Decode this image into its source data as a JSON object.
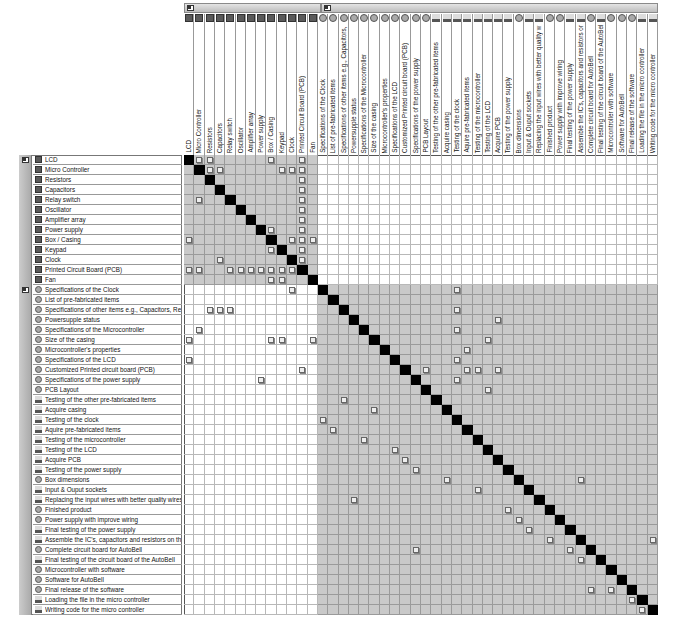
{
  "groups": [
    {
      "name": "components",
      "icon": "group-collapse-icon",
      "start": 0,
      "end": 12
    },
    {
      "name": "process",
      "icon": "group-collapse-icon",
      "start": 13,
      "end": 45
    }
  ],
  "items": [
    {
      "label": "LCD",
      "type": "comp"
    },
    {
      "label": "Micro Controller",
      "type": "comp"
    },
    {
      "label": "Resistors",
      "type": "comp"
    },
    {
      "label": "Capacitors",
      "type": "comp"
    },
    {
      "label": "Relay switch",
      "type": "comp"
    },
    {
      "label": "Oscillator",
      "type": "comp"
    },
    {
      "label": "Amplifier array",
      "type": "comp"
    },
    {
      "label": "Power supply",
      "type": "comp"
    },
    {
      "label": "Box / Casing",
      "type": "comp"
    },
    {
      "label": "Keypad",
      "type": "comp"
    },
    {
      "label": "Clock",
      "type": "comp"
    },
    {
      "label": "Printed Circuit Board (PCB)",
      "type": "comp"
    },
    {
      "label": "Fan",
      "type": "comp"
    },
    {
      "label": "Specifications of the Clock",
      "type": "spec"
    },
    {
      "label": "List of pre-fabricated items",
      "type": "spec"
    },
    {
      "label": "Specifications of other items e.g., Capacitors, Resistors etc",
      "type": "spec"
    },
    {
      "label": "Powersupple status",
      "type": "spec"
    },
    {
      "label": "Specifications of the Microcontroller",
      "type": "spec"
    },
    {
      "label": "Size of the casing",
      "type": "spec"
    },
    {
      "label": "Microcontroller's properties",
      "type": "spec"
    },
    {
      "label": "Specifications of the LCD",
      "type": "spec"
    },
    {
      "label": "Customized Printed circuit board (PCB)",
      "type": "spec"
    },
    {
      "label": "Specifications of the power supply",
      "type": "spec"
    },
    {
      "label": "PCB Layout",
      "type": "spec"
    },
    {
      "label": "Testing of the other pre-fabricated items",
      "type": "task"
    },
    {
      "label": "Acquire casing",
      "type": "task"
    },
    {
      "label": "Testing of the clock",
      "type": "task"
    },
    {
      "label": "Aquire pre-fabricated items",
      "type": "task"
    },
    {
      "label": "Testing of the microcontroller",
      "type": "task"
    },
    {
      "label": "Testing of the LCD",
      "type": "task"
    },
    {
      "label": "Acquire PCB",
      "type": "task"
    },
    {
      "label": "Testing of the power supply",
      "type": "task"
    },
    {
      "label": "Box dimensions",
      "type": "spec"
    },
    {
      "label": "Input & Ouput sockets",
      "type": "task"
    },
    {
      "label": "Replacing the input wires with better quality wires for product",
      "type": "task"
    },
    {
      "label": "Finished product",
      "type": "spec"
    },
    {
      "label": "Power supply with improve wiring",
      "type": "spec"
    },
    {
      "label": "Final testing of the power supply",
      "type": "task"
    },
    {
      "label": "Assemble the IC's, capacitors and resistors on the PCB",
      "type": "task"
    },
    {
      "label": "Complete circuit board for AutoBell",
      "type": "spec"
    },
    {
      "label": "Final testing of the circuit board of the AutoBell",
      "type": "task"
    },
    {
      "label": "Microcontroller with software",
      "type": "spec"
    },
    {
      "label": "Software for AutoBell",
      "type": "spec"
    },
    {
      "label": "Final release of the software",
      "type": "spec"
    },
    {
      "label": "Loading the file in the micro controller",
      "type": "task"
    },
    {
      "label": "Writing code for the micro controller",
      "type": "task"
    },
    {
      "label": "Testing the software",
      "type": "task"
    },
    {
      "label": "Final testing of the MC",
      "type": "task"
    },
    {
      "label": "Fully tested MC",
      "type": "spec"
    }
  ],
  "dependencies": [
    [
      0,
      1
    ],
    [
      0,
      2
    ],
    [
      0,
      8
    ],
    [
      0,
      11
    ],
    [
      1,
      2
    ],
    [
      1,
      3
    ],
    [
      1,
      9
    ],
    [
      1,
      10
    ],
    [
      1,
      11
    ],
    [
      2,
      11
    ],
    [
      3,
      11
    ],
    [
      4,
      1
    ],
    [
      4,
      11
    ],
    [
      5,
      11
    ],
    [
      6,
      11
    ],
    [
      7,
      8
    ],
    [
      7,
      11
    ],
    [
      8,
      0
    ],
    [
      8,
      8
    ],
    [
      8,
      10
    ],
    [
      8,
      11
    ],
    [
      8,
      12
    ],
    [
      9,
      8
    ],
    [
      9,
      11
    ],
    [
      10,
      3
    ],
    [
      10,
      11
    ],
    [
      11,
      0
    ],
    [
      11,
      1
    ],
    [
      11,
      4
    ],
    [
      11,
      5
    ],
    [
      11,
      6
    ],
    [
      11,
      7
    ],
    [
      11,
      8
    ],
    [
      11,
      9
    ],
    [
      11,
      10
    ],
    [
      12,
      8
    ],
    [
      12,
      9
    ],
    [
      13,
      10
    ],
    [
      13,
      26
    ],
    [
      15,
      2
    ],
    [
      15,
      3
    ],
    [
      15,
      4
    ],
    [
      15,
      26
    ],
    [
      16,
      30
    ],
    [
      17,
      1
    ],
    [
      17,
      26
    ],
    [
      18,
      0
    ],
    [
      18,
      8
    ],
    [
      18,
      9
    ],
    [
      18,
      12
    ],
    [
      18,
      29
    ],
    [
      19,
      27
    ],
    [
      20,
      0
    ],
    [
      20,
      26
    ],
    [
      21,
      11
    ],
    [
      21,
      23
    ],
    [
      21,
      27
    ],
    [
      21,
      28
    ],
    [
      21,
      30
    ],
    [
      22,
      7
    ],
    [
      22,
      26
    ],
    [
      23,
      29
    ],
    [
      24,
      15
    ],
    [
      25,
      18
    ],
    [
      26,
      13
    ],
    [
      27,
      14
    ],
    [
      28,
      17
    ],
    [
      29,
      20
    ],
    [
      30,
      21
    ],
    [
      31,
      22
    ],
    [
      32,
      25
    ],
    [
      32,
      38
    ],
    [
      33,
      28
    ],
    [
      34,
      16
    ],
    [
      35,
      31
    ],
    [
      36,
      32
    ],
    [
      37,
      33
    ],
    [
      38,
      35
    ],
    [
      38,
      45
    ],
    [
      39,
      22
    ],
    [
      39,
      37
    ],
    [
      40,
      38
    ],
    [
      41,
      41
    ],
    [
      42,
      42
    ],
    [
      43,
      39
    ],
    [
      43,
      41
    ],
    [
      44,
      43
    ],
    [
      45,
      44
    ]
  ]
}
